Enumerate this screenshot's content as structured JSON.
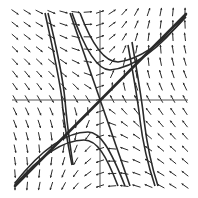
{
  "figure": {
    "kind": "phase-portrait",
    "background": "#ffffff",
    "ink": "#2a2a2a",
    "axis_color": "#555555",
    "plot_area": {
      "x0": 15,
      "y0": 12,
      "x1": 185,
      "y1": 186
    },
    "origin": {
      "x": 100,
      "y": 100
    },
    "grid": {
      "cols": 15,
      "rows": 15,
      "spacing": 11.5
    },
    "separatrix": {
      "from": [
        15,
        186
      ],
      "to": [
        186,
        14
      ],
      "label": "diagonal line y = x"
    },
    "curves": [
      {
        "name": "left-hyperbola-outer",
        "d": "M45,13 C52,45 60,80 62,100 C64,125 68,145 72,165"
      },
      {
        "name": "left-hyperbola-inner",
        "d": "M48,13 C56,45 63,80 65,100 C67,125 70,145 73,165"
      },
      {
        "name": "steep-line-through-origin",
        "d": "M70,13 L130,186"
      },
      {
        "name": "upper-right-curve-1",
        "d": "M72,13 C85,50 98,70 110,70 C130,68 155,55 186,15"
      },
      {
        "name": "upper-right-curve-2",
        "d": "M80,13 C92,45 104,62 118,62 C135,60 158,48 186,17"
      },
      {
        "name": "right-hyperbola-outer",
        "d": "M128,45 C134,80 138,100 140,120 C143,145 148,165 155,186"
      },
      {
        "name": "right-hyperbola-inner",
        "d": "M132,42 C138,78 142,100 144,120 C147,145 151,165 158,186"
      },
      {
        "name": "lower-left-curve-1",
        "d": "M15,183 C45,145 70,132 88,132 C100,132 110,148 125,186"
      },
      {
        "name": "lower-left-curve-2",
        "d": "M15,185 C45,150 68,140 84,140 C97,140 106,155 118,186"
      }
    ]
  }
}
